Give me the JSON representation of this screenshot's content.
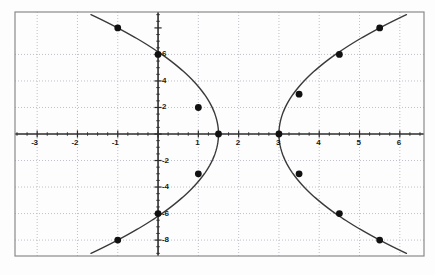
{
  "chart_data": {
    "type": "scatter",
    "title": "",
    "xlabel": "",
    "ylabel": "",
    "xlim": [
      -3.55,
      6.6
    ],
    "ylim": [
      -9.2,
      9.2
    ],
    "grid": true,
    "grid_style": "dotted",
    "legend": "none",
    "x_ticks": [
      -3,
      -2,
      -1,
      1,
      2,
      3,
      4,
      5,
      6
    ],
    "x_tick_labels": [
      "-3",
      "-2",
      "-1",
      "1",
      "2",
      "3",
      "4",
      "5",
      "6"
    ],
    "y_ticks": [
      -8,
      -6,
      -4,
      -2,
      2,
      4,
      6
    ],
    "y_tick_labels": [
      "-8",
      "-6",
      "-4",
      "-2",
      "2",
      "4",
      "6"
    ],
    "x_minor_step": 0.25,
    "y_minor_step": 0.5,
    "series": [
      {
        "name": "left-parabola",
        "description": "sideways parabola opening to the left, vertex (1.5, 0)",
        "vertex": [
          1.5,
          0
        ],
        "opens": "left",
        "curve_points": [
          [
            -1.0,
            8.0
          ],
          [
            0.0,
            6.0
          ],
          [
            1.0,
            2.0
          ],
          [
            1.5,
            0.0
          ],
          [
            1.0,
            -3.0
          ],
          [
            0.0,
            -6.0
          ],
          [
            -1.0,
            -8.0
          ]
        ],
        "marked_points": [
          [
            -1.0,
            8.0
          ],
          [
            0.0,
            6.0
          ],
          [
            1.0,
            2.0
          ],
          [
            1.5,
            0.0
          ],
          [
            1.0,
            -3.0
          ],
          [
            0.0,
            -6.0
          ],
          [
            -1.0,
            -8.0
          ]
        ]
      },
      {
        "name": "right-parabola",
        "description": "sideways parabola opening to the right, vertex (3, 0)",
        "vertex": [
          3.0,
          0
        ],
        "opens": "right",
        "curve_points": [
          [
            5.5,
            8.0
          ],
          [
            4.5,
            6.0
          ],
          [
            3.5,
            3.0
          ],
          [
            3.0,
            0.0
          ],
          [
            3.5,
            -3.0
          ],
          [
            4.5,
            -6.0
          ],
          [
            5.5,
            -8.0
          ]
        ],
        "marked_points": [
          [
            5.5,
            8.0
          ],
          [
            4.5,
            6.0
          ],
          [
            3.5,
            3.0
          ],
          [
            3.0,
            0.0
          ],
          [
            3.5,
            -3.0
          ],
          [
            4.5,
            -6.0
          ],
          [
            5.5,
            -8.0
          ]
        ]
      }
    ],
    "colors": {
      "curve": "#3a3a3a",
      "marker": "#111111",
      "axis": "#2b2b2b",
      "grid": "#b9b9c4",
      "border": "#8a8a8a",
      "background": "#fdfdfd",
      "tick_label": "#1a1a1a"
    }
  },
  "axis_labels": {
    "x": [
      {
        "text": "-3",
        "value": -3
      },
      {
        "text": "-2",
        "value": -2
      },
      {
        "text": "-1",
        "value": -1
      },
      {
        "text": "1",
        "value": 1
      },
      {
        "text": "2",
        "value": 2
      },
      {
        "text": "3",
        "value": 3
      },
      {
        "text": "4",
        "value": 4
      },
      {
        "text": "5",
        "value": 5
      },
      {
        "text": "6",
        "value": 6
      }
    ],
    "y": [
      {
        "text": "6",
        "value": 6
      },
      {
        "text": "4",
        "value": 4
      },
      {
        "text": "2",
        "value": 2
      },
      {
        "text": "-2",
        "value": -2
      },
      {
        "text": "-4",
        "value": -4
      },
      {
        "text": "-6",
        "value": -6
      },
      {
        "text": "-8",
        "value": -8
      }
    ]
  }
}
